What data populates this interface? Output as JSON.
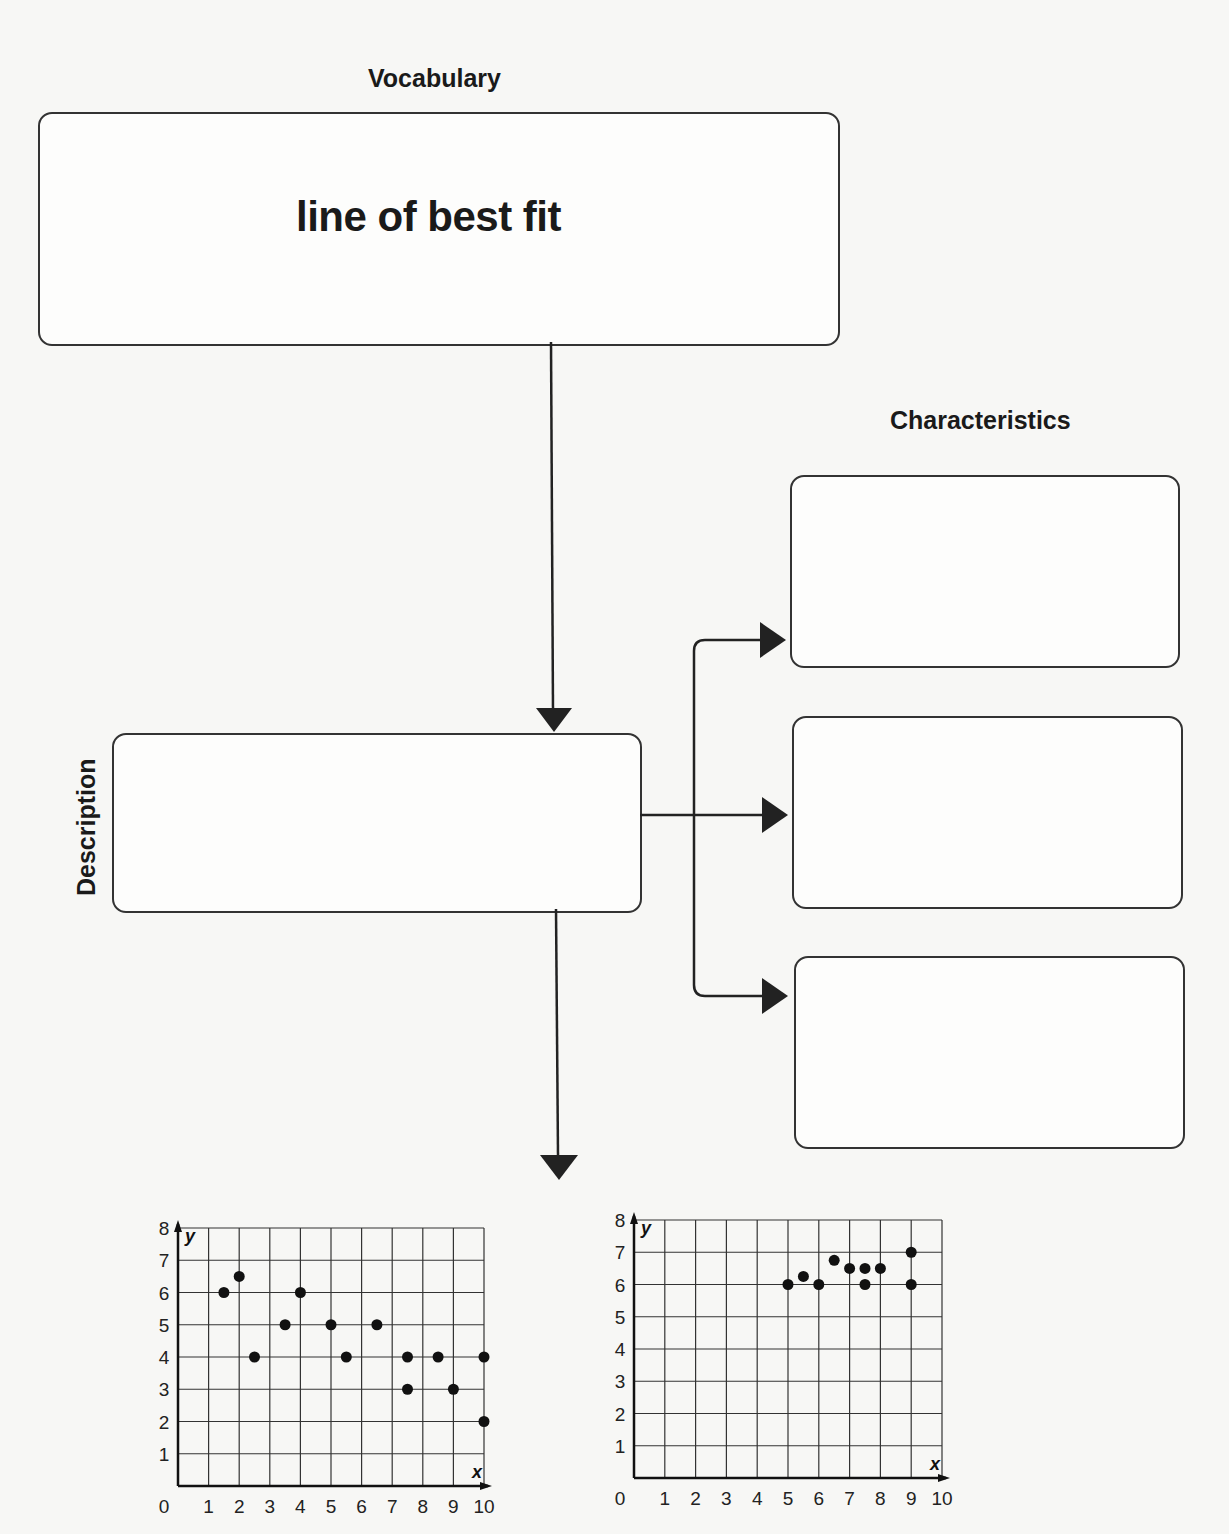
{
  "vocabulary_label": "Vocabulary",
  "term": "line of best fit",
  "characteristics_label": "Characteristics",
  "description_label": "Description",
  "characteristics_boxes": [
    "",
    "",
    ""
  ],
  "description_box": "",
  "chart_data": [
    {
      "type": "scatter",
      "title": "",
      "xlabel": "x",
      "ylabel": "y",
      "xlim": [
        0,
        10
      ],
      "ylim": [
        0,
        8
      ],
      "grid": true,
      "x_ticks": [
        0,
        1,
        2,
        3,
        4,
        5,
        6,
        7,
        8,
        9,
        10
      ],
      "y_ticks": [
        1,
        2,
        3,
        4,
        5,
        6,
        7,
        8
      ],
      "points": [
        [
          1.5,
          6
        ],
        [
          2,
          6.5
        ],
        [
          2.5,
          4
        ],
        [
          3.5,
          5
        ],
        [
          4,
          6
        ],
        [
          5,
          5
        ],
        [
          5.5,
          4
        ],
        [
          6.5,
          5
        ],
        [
          7.5,
          4
        ],
        [
          7.5,
          3
        ],
        [
          8.5,
          4
        ],
        [
          9,
          3
        ],
        [
          10,
          4
        ],
        [
          10,
          2
        ]
      ]
    },
    {
      "type": "scatter",
      "title": "",
      "xlabel": "x",
      "ylabel": "y",
      "xlim": [
        0,
        10
      ],
      "ylim": [
        0,
        8
      ],
      "grid": true,
      "x_ticks": [
        0,
        1,
        2,
        3,
        4,
        5,
        6,
        7,
        8,
        9,
        10
      ],
      "y_ticks": [
        1,
        2,
        3,
        4,
        5,
        6,
        7,
        8
      ],
      "points": [
        [
          5,
          6
        ],
        [
          5.5,
          6.25
        ],
        [
          6,
          6
        ],
        [
          6.5,
          6.75
        ],
        [
          7,
          6.5
        ],
        [
          7.5,
          6.5
        ],
        [
          7.5,
          6
        ],
        [
          8,
          6.5
        ],
        [
          9,
          7
        ],
        [
          9,
          6
        ]
      ]
    }
  ]
}
